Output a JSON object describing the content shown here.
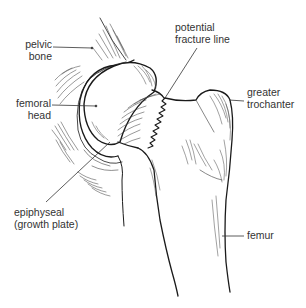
{
  "diagram": {
    "type": "anatomical-illustration",
    "colors": {
      "ink": "#1a1a1a",
      "text": "#333333",
      "background": "#ffffff"
    },
    "labels": {
      "pelvic_bone": {
        "line1": "pelvic",
        "line2": "bone"
      },
      "femoral_head": {
        "line1": "femoral",
        "line2": "head"
      },
      "fracture_line": {
        "line1": "potential",
        "line2": "fracture line"
      },
      "greater_trochanter": {
        "line1": "greater",
        "line2": "trochanter"
      },
      "epiphyseal": {
        "line1": "epiphyseal",
        "line2": "(growth plate)"
      },
      "femur": {
        "line1": "femur"
      }
    }
  }
}
